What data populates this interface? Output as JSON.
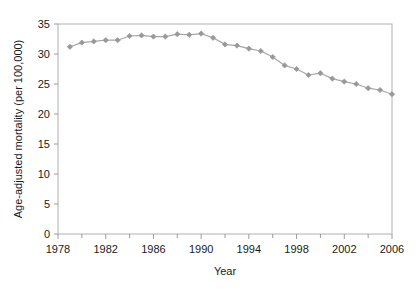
{
  "chart_data": {
    "type": "line",
    "title": "",
    "xlabel": "Year",
    "ylabel": "Age-adjusted mortality (per 100,000)",
    "xlim": [
      1978,
      2006
    ],
    "ylim": [
      0,
      35
    ],
    "y_ticks": [
      0,
      5,
      10,
      15,
      20,
      25,
      30,
      35
    ],
    "y_tick_labels": [
      "0",
      "5",
      "10",
      "15",
      "20",
      "25",
      "30",
      "35"
    ],
    "x_ticks": [
      1978,
      1982,
      1986,
      1990,
      1994,
      1998,
      2002,
      2006
    ],
    "x_tick_labels": [
      "1978",
      "1982",
      "1986",
      "1990",
      "1994",
      "1998",
      "2002",
      "2006"
    ],
    "x_minor_tick_interval": 2,
    "grid": false,
    "legend": null,
    "marker": "diamond",
    "series_color": "#999999",
    "line_color": "#a6a6a6",
    "x": [
      1979,
      1980,
      1981,
      1982,
      1983,
      1984,
      1985,
      1986,
      1987,
      1988,
      1989,
      1990,
      1991,
      1992,
      1993,
      1994,
      1995,
      1996,
      1997,
      1998,
      1999,
      2000,
      2001,
      2002,
      2003,
      2004,
      2005,
      2006
    ],
    "values": [
      31.2,
      31.9,
      32.1,
      32.3,
      32.3,
      33.0,
      33.1,
      32.9,
      32.9,
      33.3,
      33.2,
      33.4,
      32.7,
      31.6,
      31.4,
      30.9,
      30.5,
      29.5,
      28.1,
      27.5,
      26.5,
      26.8,
      25.9,
      25.4,
      25.0,
      24.3,
      24.0,
      23.3
    ],
    "series": [
      {
        "name": "Age-adjusted mortality",
        "values": [
          31.2,
          31.9,
          32.1,
          32.3,
          32.3,
          33.0,
          33.1,
          32.9,
          32.9,
          33.3,
          33.2,
          33.4,
          32.7,
          31.6,
          31.4,
          30.9,
          30.5,
          29.5,
          28.1,
          27.5,
          26.5,
          26.8,
          25.9,
          25.4,
          25.0,
          24.3,
          24.0,
          23.3
        ]
      }
    ]
  },
  "labels": {
    "x_axis_title": "Year",
    "y_axis_title": "Age-adjusted mortality (per 100,000)"
  }
}
